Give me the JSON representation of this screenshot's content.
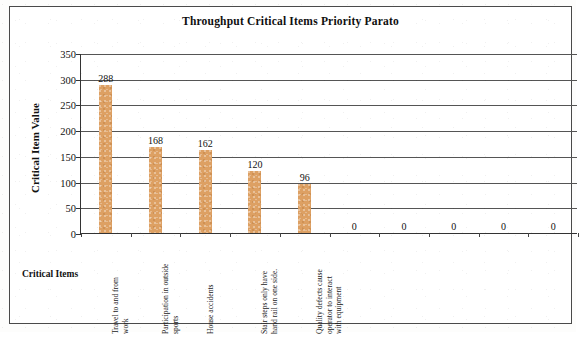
{
  "chart_data": {
    "type": "bar",
    "title": "Throughput Critical Items Priority Parato",
    "xlabel": "Critical Items",
    "ylabel": "Critical Item Value",
    "ylim": [
      0,
      350
    ],
    "ytick_labels": [
      "350",
      "300",
      "250",
      "200",
      "150",
      "100",
      "50",
      "0"
    ],
    "ytick_values": [
      350,
      300,
      250,
      200,
      150,
      100,
      50,
      0
    ],
    "grid": true,
    "legend": "none",
    "categories": [
      "Travel to and from work",
      "Participation in outside sports",
      "House accidents",
      "Stair steps only have hand rail on one side.",
      "Quality defects cause operator to interact with equipment",
      "",
      "",
      "",
      "",
      ""
    ],
    "category_lines": [
      [
        "Travel to and from",
        "work"
      ],
      [
        "Participation in outside",
        "sports"
      ],
      [
        "House accidents"
      ],
      [
        "Stair steps only have",
        "hand rail on one side."
      ],
      [
        "Quality defects cause",
        "operator to interact",
        "with equipment"
      ],
      [
        ""
      ],
      [
        ""
      ],
      [
        ""
      ],
      [
        ""
      ],
      [
        ""
      ]
    ],
    "values": [
      288,
      168,
      162,
      120,
      96,
      0,
      0,
      0,
      0,
      0
    ],
    "value_labels": [
      "288",
      "168",
      "162",
      "120",
      "96",
      "0",
      "0",
      "0",
      "0",
      "0"
    ],
    "bar_color": "#dda063",
    "axis_color": "#333333",
    "grid_color": "#555555",
    "frame_color": "#4a4a4a"
  }
}
